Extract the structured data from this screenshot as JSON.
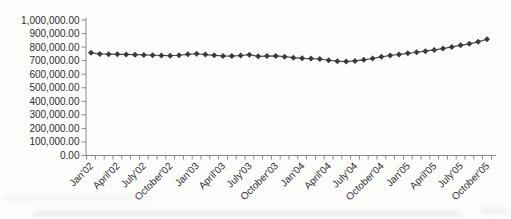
{
  "chart_data": {
    "type": "line",
    "title": "",
    "xlabel": "",
    "ylabel": "",
    "grid": false,
    "legend": false,
    "ylim": [
      0,
      1000000
    ],
    "ytick_step": 100000,
    "ytick_labels": [
      "0.00",
      "100,000.00",
      "200,000.00",
      "300,000.00",
      "400,000.00",
      "500,000.00",
      "600,000.00",
      "700,000.00",
      "800,000.00",
      "900,000.00",
      "1,000,000.00"
    ],
    "x": [
      "Jan'02",
      "Feb'02",
      "Mar'02",
      "April'02",
      "May'02",
      "June'02",
      "July'02",
      "Aug'02",
      "Sep'02",
      "October'02",
      "Nov'02",
      "Dec'02",
      "Jan'03",
      "Feb'03",
      "Mar'03",
      "April'03",
      "May'03",
      "June'03",
      "July'03",
      "Aug'03",
      "Sep'03",
      "October'03",
      "Nov'03",
      "Dec'03",
      "Jan'04",
      "Feb'04",
      "Mar'04",
      "April'04",
      "May'04",
      "June'04",
      "July'04",
      "Aug'04",
      "Sep'04",
      "October'04",
      "Nov'04",
      "Dec'04",
      "Jan'05",
      "Feb'05",
      "Mar'05",
      "April'05",
      "May'05",
      "June'05",
      "July'05",
      "Aug'05",
      "Sep'05",
      "October'05"
    ],
    "visible_tick_labels": [
      "Jan'02",
      "April'02",
      "July'02",
      "October'02",
      "Jan'03",
      "April'03",
      "July'03",
      "October'03",
      "Jan'04",
      "April'04",
      "July'04",
      "October'04",
      "Jan'05",
      "April'05",
      "July'05",
      "October'05"
    ],
    "tick_label_every": 3,
    "series": [
      {
        "name": "monthly-value",
        "marker": "diamond",
        "color": "#3a3a3a",
        "line_color": "#4a4a4a",
        "values": [
          758000,
          750000,
          748000,
          747000,
          746000,
          744000,
          742000,
          740000,
          738000,
          737000,
          740000,
          747000,
          751000,
          745000,
          739000,
          735000,
          734000,
          738000,
          744000,
          732000,
          734000,
          735000,
          729000,
          722000,
          717000,
          715000,
          712000,
          703000,
          696000,
          693000,
          698000,
          706000,
          716000,
          728000,
          738000,
          746000,
          754000,
          762000,
          770000,
          779000,
          789000,
          801000,
          813000,
          824000,
          839000,
          858000
        ]
      }
    ],
    "axis_color": "#8a8a8a",
    "tick_label_color": "#2e2e2e"
  }
}
